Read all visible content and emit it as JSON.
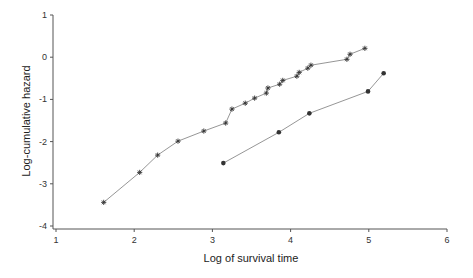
{
  "chart_data": {
    "type": "line",
    "title": "",
    "xlabel": "Log of survival time",
    "ylabel": "Log-cumulative hazard",
    "xlim": [
      1,
      6
    ],
    "ylim": [
      -4,
      1
    ],
    "x_ticks": [
      "1",
      "2",
      "3",
      "4",
      "5",
      "6"
    ],
    "y_ticks": [
      "1",
      "0",
      "-1",
      "-2",
      "-3",
      "-4"
    ],
    "grid": false,
    "legend": null,
    "series": [
      {
        "name": "Group 1 (asterisk markers)",
        "marker": "asterisk",
        "x": [
          1.61,
          2.07,
          2.3,
          2.56,
          2.89,
          3.17,
          3.25,
          3.42,
          3.54,
          3.69,
          3.71,
          3.86,
          3.9,
          4.08,
          4.11,
          4.22,
          4.26,
          4.72,
          4.76,
          4.95
        ],
        "y": [
          -3.44,
          -2.73,
          -2.32,
          -1.99,
          -1.75,
          -1.56,
          -1.23,
          -1.09,
          -0.97,
          -0.85,
          -0.73,
          -0.64,
          -0.55,
          -0.45,
          -0.36,
          -0.26,
          -0.19,
          -0.05,
          0.07,
          0.21
        ]
      },
      {
        "name": "Group 2 (filled circle markers)",
        "marker": "circle",
        "x": [
          3.14,
          3.85,
          4.24,
          4.99,
          5.19
        ],
        "y": [
          -2.51,
          -1.78,
          -1.33,
          -0.81,
          -0.38
        ]
      }
    ]
  },
  "colors": {
    "axis": "#555555",
    "line": "#8a8a8a",
    "marker": "#333333"
  }
}
